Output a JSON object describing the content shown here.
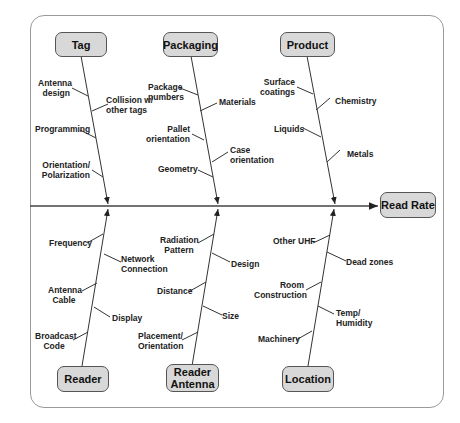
{
  "effect": "Read Rate",
  "categories": {
    "tag": {
      "label": "Tag",
      "causes": [
        "Antenna design",
        "Collision w/ other tags",
        "Programming",
        "Orientation/ Polarization"
      ]
    },
    "packaging": {
      "label": "Packaging",
      "causes": [
        "Package numbers",
        "Materials",
        "Pallet orientation",
        "Case orientation",
        "Geometry"
      ]
    },
    "product": {
      "label": "Product",
      "causes": [
        "Surface coatings",
        "Chemistry",
        "Liquids",
        "Metals"
      ]
    },
    "reader": {
      "label": "Reader",
      "causes": [
        "Frequency",
        "Network Connection",
        "Antenna Cable",
        "Display",
        "Broadcast Code"
      ]
    },
    "reader_antenna": {
      "label": "Reader Antenna",
      "causes": [
        "Radiation Pattern",
        "Design",
        "Distance",
        "Size",
        "Placement/ Orientation"
      ]
    },
    "location": {
      "label": "Location",
      "causes": [
        "Other UHF",
        "Dead zones",
        "Room Construction",
        "Temp/ Humidity",
        "Machinery"
      ]
    }
  },
  "labels": {
    "tag_1a": "Antenna",
    "tag_1b": "design",
    "tag_2a": "Collision w/",
    "tag_2b": "other tags",
    "tag_3": "Programming",
    "tag_4a": "Orientation/",
    "tag_4b": "Polarization",
    "pkg_1a": "Package",
    "pkg_1b": "numbers",
    "pkg_2": "Materials",
    "pkg_3a": "Pallet",
    "pkg_3b": "orientation",
    "pkg_4a": "Case",
    "pkg_4b": "orientation",
    "pkg_5": "Geometry",
    "prod_1a": "Surface",
    "prod_1b": "coatings",
    "prod_2": "Chemistry",
    "prod_3": "Liquids",
    "prod_4": "Metals",
    "rdr_1": "Frequency",
    "rdr_2a": "Network",
    "rdr_2b": "Connection",
    "rdr_3a": "Antenna",
    "rdr_3b": "Cable",
    "rdr_4": "Display",
    "rdr_5a": "Broadcast",
    "rdr_5b": "Code",
    "ant_1a": "Radiation",
    "ant_1b": "Pattern",
    "ant_2": "Design",
    "ant_3": "Distance",
    "ant_4": "Size",
    "ant_5a": "Placement/",
    "ant_5b": "Orientation",
    "loc_1": "Other UHF",
    "loc_2": "Dead zones",
    "loc_3a": "Room",
    "loc_3b": "Construction",
    "loc_4a": "Temp/",
    "loc_4b": "Humidity",
    "loc_5": "Machinery",
    "box_reader_antenna_a": "Reader",
    "box_reader_antenna_b": "Antenna"
  },
  "colors": {
    "box_fill": "#d8d8d8",
    "box_border": "#555555",
    "line": "#333333",
    "frame": "#9a9a9a"
  }
}
